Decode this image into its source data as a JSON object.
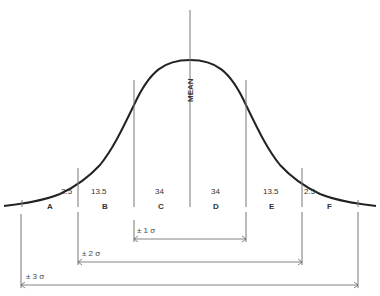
{
  "diagram": {
    "type": "normal-distribution",
    "mean_label": "MEAN",
    "regions": [
      {
        "letter": "A",
        "percent": "2.5"
      },
      {
        "letter": "B",
        "percent": "13.5"
      },
      {
        "letter": "C",
        "percent": "34"
      },
      {
        "letter": "D",
        "percent": "34"
      },
      {
        "letter": "E",
        "percent": "13.5"
      },
      {
        "letter": "F",
        "percent": "2.5"
      }
    ],
    "ranges": [
      {
        "label": "± 1 σ"
      },
      {
        "label": "± 2 σ"
      },
      {
        "label": "± 3 σ"
      }
    ],
    "colors": {
      "curve": "#222222",
      "lines": "#777777",
      "text": "#333333"
    }
  }
}
